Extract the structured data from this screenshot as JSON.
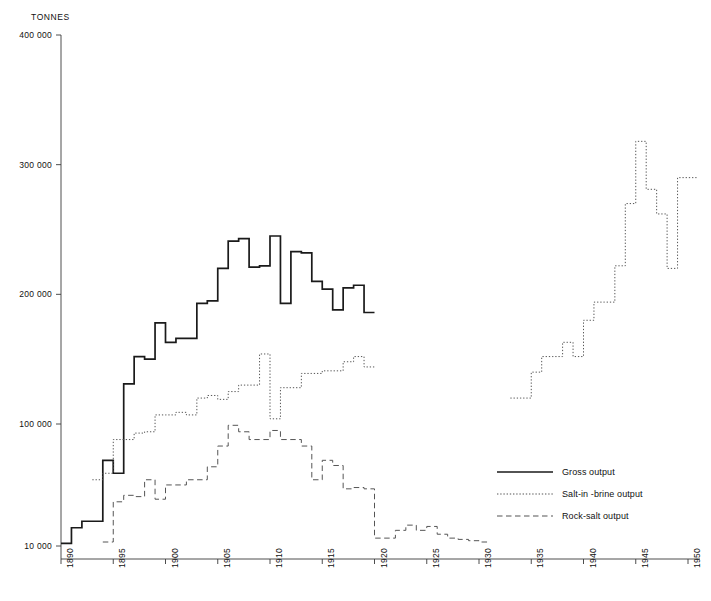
{
  "chart_data": {
    "type": "line",
    "title": "",
    "xlabel": "",
    "ylabel": "TONNES",
    "unit_label": "TONNES",
    "xlim": [
      1889,
      1951
    ],
    "ylim": [
      0,
      400000
    ],
    "grid": false,
    "step_style": "step-post",
    "legend_position": "center-right",
    "y_ticks": [
      10000,
      100000,
      200000,
      300000,
      400000
    ],
    "y_tick_labels": [
      "10 000",
      "100 000",
      "200 000",
      "300 000",
      "400 000"
    ],
    "x_ticks": [
      1890,
      1895,
      1900,
      1905,
      1910,
      1915,
      1920,
      1925,
      1930,
      1935,
      1940,
      1945,
      1950
    ],
    "x_tick_labels": [
      "1890",
      "1895",
      "1900",
      "1905",
      "1910",
      "1915",
      "1920",
      "1925",
      "1930",
      "1935",
      "1940",
      "1945",
      "1950"
    ],
    "series": [
      {
        "name": "Gross output",
        "style": "solid",
        "color": "#1a1a1a",
        "x": [
          1890,
          1891,
          1892,
          1893,
          1894,
          1895,
          1896,
          1897,
          1898,
          1899,
          1900,
          1901,
          1902,
          1903,
          1904,
          1905,
          1906,
          1907,
          1908,
          1909,
          1910,
          1911,
          1912,
          1913,
          1914,
          1915,
          1916,
          1917,
          1918,
          1919
        ],
        "values": [
          8000,
          20000,
          25000,
          25000,
          72000,
          62000,
          131000,
          152000,
          150000,
          178000,
          163000,
          166000,
          166000,
          193000,
          195000,
          220000,
          241000,
          243000,
          221000,
          222000,
          245000,
          193000,
          233000,
          232000,
          210000,
          204000,
          188000,
          205000,
          207000,
          186000
        ]
      },
      {
        "name": "Salt-in -brine output",
        "style": "dotted",
        "color": "#555555",
        "segments": [
          {
            "x": [
              1893,
              1894,
              1895,
              1896,
              1897,
              1898,
              1899,
              1900,
              1901,
              1902,
              1903,
              1904,
              1905,
              1906,
              1907,
              1908,
              1909,
              1910,
              1911,
              1912,
              1913,
              1914,
              1915,
              1916,
              1917,
              1918,
              1919
            ],
            "values": [
              57000,
              62000,
              88000,
              88000,
              93000,
              94000,
              107000,
              107000,
              109000,
              107000,
              120000,
              122000,
              119000,
              125000,
              130000,
              130000,
              154000,
              104000,
              128000,
              128000,
              139000,
              139000,
              141000,
              141000,
              148000,
              152000,
              144000
            ]
          },
          {
            "x": [
              1933,
              1934,
              1935,
              1936,
              1937,
              1938,
              1939,
              1940,
              1941,
              1942,
              1943,
              1944,
              1945,
              1946,
              1947,
              1948,
              1949,
              1950
            ],
            "values": [
              120000,
              120000,
              140000,
              152000,
              152000,
              163000,
              152000,
              180000,
              194000,
              194000,
              222000,
              270000,
              318000,
              281000,
              262000,
              220000,
              290000,
              290000
            ]
          }
        ]
      },
      {
        "name": "Rock-salt output",
        "style": "dashed",
        "color": "#555555",
        "x": [
          1894,
          1895,
          1896,
          1897,
          1898,
          1899,
          1900,
          1901,
          1902,
          1903,
          1904,
          1905,
          1906,
          1907,
          1908,
          1909,
          1910,
          1911,
          1912,
          1913,
          1914,
          1915,
          1916,
          1917,
          1918,
          1919,
          1920,
          1921,
          1922,
          1923,
          1924,
          1925,
          1926,
          1927,
          1928,
          1929,
          1930
        ],
        "values": [
          9000,
          40000,
          45000,
          44000,
          57000,
          42000,
          53000,
          53000,
          57000,
          57000,
          67000,
          83000,
          99000,
          94000,
          88000,
          88000,
          95000,
          88000,
          88000,
          83000,
          57000,
          72000,
          68000,
          50000,
          51000,
          50000,
          12000,
          12000,
          18000,
          22000,
          18000,
          21000,
          15000,
          12000,
          11000,
          10000,
          9000
        ]
      }
    ]
  },
  "legend": {
    "items": [
      {
        "label": "Gross output",
        "style": "solid"
      },
      {
        "label": "Salt-in -brine output",
        "style": "dotted"
      },
      {
        "label": "Rock-salt output",
        "style": "dashed"
      }
    ]
  },
  "axes": {
    "y_unit": "TONNES"
  }
}
